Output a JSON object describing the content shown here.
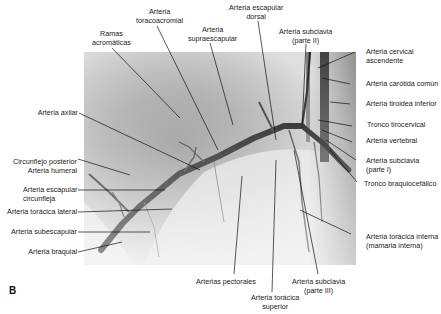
{
  "figure": {
    "panel_letter": "B",
    "labels": {
      "ramas_acromaticas": [
        "Ramas",
        "acromáticas"
      ],
      "toracoacromial": [
        "Arteria",
        "toracoacromial"
      ],
      "supraescapular": [
        "Arteria",
        "supraescapular"
      ],
      "escapular_dorsal": [
        "Arteria escapular",
        "dorsal"
      ],
      "subclavia_II": [
        "Arteria subclavia",
        "(parte II)"
      ],
      "cervical_ascendente": [
        "Arteria cervical",
        "ascendente"
      ],
      "carotida_comun": "Arteria carótida común",
      "tiroidea_inferior": "Arteria tiroidea inferior",
      "tronco_tirocervical": "Tronco tirocervical",
      "vertebral": "Arteria vertebral",
      "subclavia_I": [
        "Arteria subclavia",
        "(parte I)"
      ],
      "braquiocefalico": "Tronco braquiocefálico",
      "axilar": "Arteria axilar",
      "circunflejo_posterior": [
        "Circunflejo posterior",
        "Arteria humeral"
      ],
      "escapular_circunfleja": [
        "Arteria escapular",
        "circunfleja"
      ],
      "toracica_lateral": "Arteria torácica lateral",
      "subescapular": "Arteria subescapular",
      "braquial": "Arteria braquial",
      "pectorales": "Arterias pectorales",
      "toracica_superior": [
        "Arteria torácica",
        "superior"
      ],
      "subclavia_III": [
        "Arteria subclavia",
        "(parte III)"
      ],
      "toracica_interna": [
        "Arteria torácica interna",
        "(mamaria interna)"
      ]
    }
  }
}
